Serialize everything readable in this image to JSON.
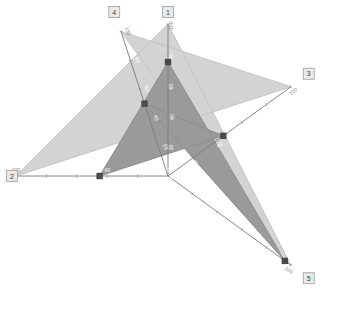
{
  "chart_data": {
    "type": "radar",
    "title": "",
    "categories": [
      "1",
      "2",
      "3",
      "4",
      "5"
    ],
    "axis_labels": [
      "1",
      "2",
      "3",
      "4",
      "5"
    ],
    "tick_values": [
      0,
      20,
      40,
      60,
      80,
      100
    ],
    "axis_range": [
      0,
      100
    ],
    "grid": false,
    "legend": "none",
    "series": [
      {
        "name": "outer",
        "fill_color": "#d3d3d3",
        "line_color": "#c4c4c4",
        "values": [
          100,
          100,
          100,
          100,
          100
        ]
      },
      {
        "name": "inner",
        "fill_color": "#9a9a9a",
        "line_color": "#8e8e8e",
        "values": [
          75,
          45,
          45,
          50,
          95
        ]
      }
    ]
  },
  "geometry": {
    "center_x": 168,
    "center_y": 176,
    "radius": 152,
    "axis_angles_deg": [
      -90,
      180,
      -36,
      252,
      36
    ]
  },
  "colors": {
    "background": "#ffffff",
    "outer_fill": "#d3d3d3",
    "inner_fill": "#9a9a9a",
    "axis_line": "#7b7b7b",
    "vertex_marker": "#4a4a4a",
    "axis_box_fill": "#e9e9e9",
    "axis_box_stroke": "#9d9d9d",
    "tick_text_inner": "#ffffff",
    "tick_text_outer": "#8a8a8a"
  }
}
